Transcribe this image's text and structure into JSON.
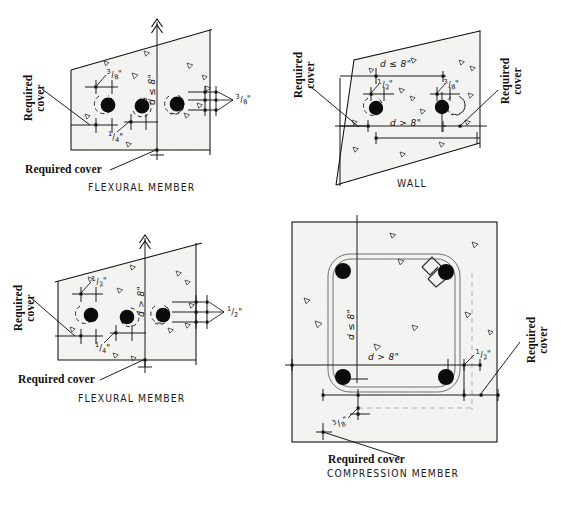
{
  "figure": {
    "ink_color": "#000000",
    "concrete_fill": "#f2f2f0",
    "hidden_line_color": "#9a9a9a"
  },
  "panels": [
    {
      "id": "flexural-member-top",
      "caption": "FLEXURAL MEMBER",
      "cover_labels": [
        {
          "id": "left-vertical",
          "text": "Required cover",
          "lines": [
            "Required",
            "cover"
          ],
          "orientation": "vertical"
        },
        {
          "id": "bottom-horizontal",
          "text": "Required cover",
          "lines": [
            "Required cover"
          ],
          "orientation": "horizontal"
        }
      ],
      "dimensions": [
        {
          "id": "bar-spacing-top",
          "value": "3/8\"",
          "numerator": "3",
          "denominator": "8",
          "unit": "\"",
          "orientation": "tilted"
        },
        {
          "id": "bar-spacing-bottom",
          "value": "1/4\"",
          "numerator": "1",
          "denominator": "4",
          "unit": "\"",
          "orientation": "horizontal"
        },
        {
          "id": "bar-spacing-right",
          "value": "3/8\"",
          "numerator": "3",
          "denominator": "8",
          "unit": "\"",
          "orientation": "tilted"
        },
        {
          "id": "depth-note",
          "value": "d ≤ 8\"",
          "orientation": "vertical"
        }
      ],
      "bars": 3
    },
    {
      "id": "wall",
      "caption": "WALL",
      "cover_labels": [
        {
          "id": "left-vertical",
          "text": "Required cover",
          "lines": [
            "Required",
            "cover"
          ],
          "orientation": "vertical"
        },
        {
          "id": "right-vertical",
          "text": "Required cover",
          "lines": [
            "Required",
            "cover"
          ],
          "orientation": "vertical"
        }
      ],
      "dimensions": [
        {
          "id": "top-depth",
          "value": "d ≤ 8\"",
          "orientation": "horizontal"
        },
        {
          "id": "bottom-depth",
          "value": "d > 8\"",
          "orientation": "horizontal"
        },
        {
          "id": "left-spacing",
          "value": "1/2\"",
          "numerator": "1",
          "denominator": "2",
          "unit": "\"",
          "orientation": "tilted"
        },
        {
          "id": "right-spacing",
          "value": "3/8\"",
          "numerator": "3",
          "denominator": "8",
          "unit": "\"",
          "orientation": "tilted"
        }
      ],
      "bars": 2
    },
    {
      "id": "flexural-member-bottom",
      "caption": "FLEXURAL MEMBER",
      "cover_labels": [
        {
          "id": "left-vertical",
          "text": "Required cover",
          "lines": [
            "Required",
            "cover"
          ],
          "orientation": "vertical"
        },
        {
          "id": "bottom-horizontal",
          "text": "Required cover",
          "lines": [
            "Required cover"
          ],
          "orientation": "horizontal"
        }
      ],
      "dimensions": [
        {
          "id": "bar-spacing-top",
          "value": "1/2\"",
          "numerator": "1",
          "denominator": "2",
          "unit": "\"",
          "orientation": "tilted"
        },
        {
          "id": "bar-spacing-bottom",
          "value": "1/4\"",
          "numerator": "1",
          "denominator": "4",
          "unit": "\"",
          "orientation": "horizontal"
        },
        {
          "id": "bar-spacing-right",
          "value": "1/2\"",
          "numerator": "1",
          "denominator": "2",
          "unit": "\"",
          "orientation": "horizontal"
        },
        {
          "id": "depth-note",
          "value": "d > 8\"",
          "orientation": "vertical"
        }
      ],
      "bars": 3
    },
    {
      "id": "compression-member",
      "caption": "COMPRESSION MEMBER",
      "cover_labels": [
        {
          "id": "right-vertical",
          "text": "Required cover",
          "lines": [
            "Required",
            "cover"
          ],
          "orientation": "vertical"
        },
        {
          "id": "bottom-horizontal",
          "text": "Required cover",
          "lines": [
            "Required cover"
          ],
          "orientation": "horizontal"
        }
      ],
      "dimensions": [
        {
          "id": "vertical-depth",
          "value": "d ≤ 8\"",
          "orientation": "vertical"
        },
        {
          "id": "horizontal-depth",
          "value": "d > 8\"",
          "orientation": "horizontal"
        },
        {
          "id": "right-spacing",
          "value": "1/2\"",
          "numerator": "1",
          "denominator": "2",
          "unit": "\"",
          "orientation": "tilted"
        },
        {
          "id": "bottom-spacing",
          "value": "3/8\"",
          "numerator": "3",
          "denominator": "8",
          "unit": "\"",
          "orientation": "tilted"
        }
      ],
      "bars": 4,
      "has_tie": true
    }
  ]
}
